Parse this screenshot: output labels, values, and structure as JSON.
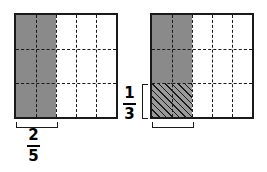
{
  "figure": {
    "colors": {
      "shade_gray": "#8a8a8a",
      "hatch_gray": "#9a9a9a",
      "outline": "#1a1a1a",
      "background": "#ffffff"
    },
    "panels": [
      {
        "name": "left-model",
        "square": {
          "columns": 5,
          "rows": 3,
          "shaded_columns": 2,
          "shaded_rows": 3,
          "shading_style": "solid-gray",
          "hatched_cells": 0
        },
        "labels": [
          {
            "name": "fraction-2-5",
            "numerator": "2",
            "denominator": "5",
            "text": "2/5",
            "position": "below",
            "bracket": "bottom"
          }
        ]
      },
      {
        "name": "right-model",
        "square": {
          "columns": 5,
          "rows": 3,
          "shaded_columns": 2,
          "shaded_rows": 2,
          "shading_style": "solid-gray",
          "hatched_region": {
            "columns": 2,
            "rows": 1,
            "style": "diagonal-hatch",
            "location": "bottom-left"
          }
        },
        "labels": [
          {
            "name": "fraction-2-5",
            "numerator": "2",
            "denominator": "5",
            "text": "2/5",
            "position": "below",
            "bracket": "bottom"
          },
          {
            "name": "fraction-1-3",
            "numerator": "1",
            "denominator": "3",
            "text": "1/3",
            "position": "left",
            "bracket": "left"
          }
        ]
      }
    ]
  }
}
